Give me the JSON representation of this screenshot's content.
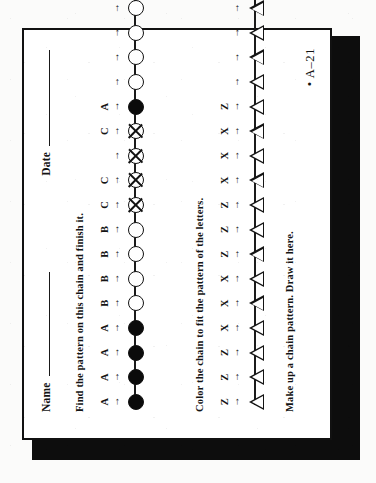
{
  "worksheet": {
    "header": {
      "name_label": "Name",
      "date_label": "Date"
    },
    "instructions": {
      "line1": "Find the pattern on this chain and finish it.",
      "line2": "Color the chain to fit the pattern of the letters.",
      "line3": "Make up a chain pattern.  Draw it here."
    },
    "page_code": "• A–21",
    "arrow_glyph": "→"
  },
  "chain_data": {
    "chain1": {
      "shape": "circle",
      "description": "Bead chain labelled with letters A, B, C; last beads blank for student to finish",
      "beads": [
        {
          "letter": "A",
          "fill": "solid"
        },
        {
          "letter": "A",
          "fill": "solid"
        },
        {
          "letter": "A",
          "fill": "solid"
        },
        {
          "letter": "A",
          "fill": "solid"
        },
        {
          "letter": "B",
          "fill": "open"
        },
        {
          "letter": "B",
          "fill": "open"
        },
        {
          "letter": "B",
          "fill": "open"
        },
        {
          "letter": "B",
          "fill": "open"
        },
        {
          "letter": "C",
          "fill": "crossed"
        },
        {
          "letter": "C",
          "fill": "crossed"
        },
        {
          "letter": "",
          "fill": "crossed"
        },
        {
          "letter": "C",
          "fill": "crossed"
        },
        {
          "letter": "A",
          "fill": "solid"
        },
        {
          "letter": "",
          "fill": "open"
        },
        {
          "letter": "",
          "fill": "open"
        },
        {
          "letter": "",
          "fill": "open"
        },
        {
          "letter": "",
          "fill": "open"
        },
        {
          "letter": "",
          "fill": "open"
        },
        {
          "letter": "",
          "fill": "open"
        }
      ]
    },
    "chain2": {
      "shape": "triangle",
      "description": "Triangle chain labelled with letters Z and X; beads left uncolored for student",
      "beads": [
        {
          "letter": "Z",
          "fill": "open"
        },
        {
          "letter": "Z",
          "fill": "open"
        },
        {
          "letter": "Z",
          "fill": "open"
        },
        {
          "letter": "X",
          "fill": "open"
        },
        {
          "letter": "X",
          "fill": "open"
        },
        {
          "letter": "X",
          "fill": "open"
        },
        {
          "letter": "Z",
          "fill": "open"
        },
        {
          "letter": "Z",
          "fill": "open"
        },
        {
          "letter": "Z",
          "fill": "open"
        },
        {
          "letter": "X",
          "fill": "open"
        },
        {
          "letter": "X",
          "fill": "open"
        },
        {
          "letter": "X",
          "fill": "open"
        },
        {
          "letter": "Z",
          "fill": "open"
        },
        {
          "letter": "",
          "fill": "open"
        },
        {
          "letter": "",
          "fill": "open"
        },
        {
          "letter": "",
          "fill": "open"
        },
        {
          "letter": "",
          "fill": "open"
        },
        {
          "letter": "",
          "fill": "open"
        },
        {
          "letter": "",
          "fill": "open"
        }
      ]
    }
  }
}
